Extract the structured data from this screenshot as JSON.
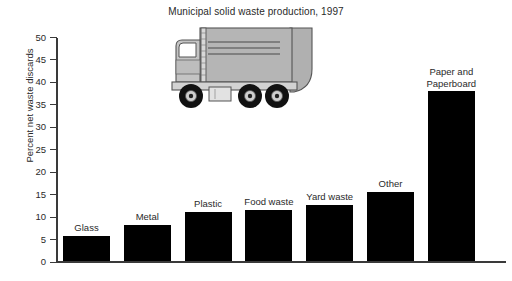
{
  "chart_data": {
    "type": "bar",
    "title": "Municipal solid waste production, 1997",
    "xlabel": "",
    "ylabel": "Percent net waste discards",
    "ylim": [
      0,
      50
    ],
    "ytick_step": 5,
    "yticks": [
      "0",
      "5",
      "10",
      "15",
      "20",
      "25",
      "30",
      "35",
      "40",
      "45",
      "50"
    ],
    "grid": false,
    "legend": "none",
    "bar_color": "#000000",
    "categories": [
      "Glass",
      "Metal",
      "Plastic",
      "Food waste",
      "Yard waste",
      "Other",
      "Paper and Paperboard"
    ],
    "values": [
      5.5,
      8,
      11,
      11.5,
      12.5,
      15.5,
      38
    ],
    "annotations": [
      "Garbage truck illustration above the plot area"
    ]
  },
  "illustration": {
    "name": "garbage-truck",
    "body_color": "#b3b3b3",
    "cab_color": "#c9c9c9",
    "outline_color": "#4d4d4d",
    "wheel_color": "#111111"
  }
}
